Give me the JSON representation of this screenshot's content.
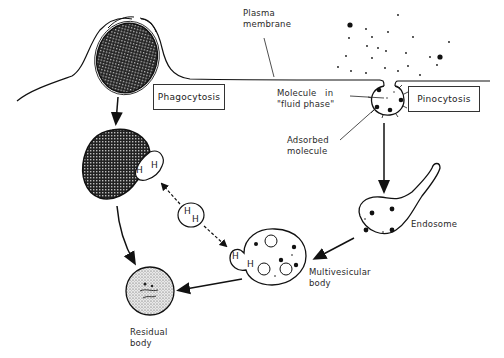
{
  "labels": {
    "plasma_membrane": "Plasma\nmembrane",
    "phagocytosis": "Phagocytosis",
    "pinocytosis": "Pinocytosis",
    "molecule_fluid_phase": "Molecule   in\n\"fluid phase\"",
    "adsorbed_molecule": "Adsorbed\nmolecule",
    "endosome": "Endosome",
    "multivesicular_body": "Multivesicular\nbody",
    "residual_body": "Residual\nbody"
  },
  "hydrolase_marks": {
    "phagosome_h1": "H",
    "phagosome_h2": "H",
    "lysosome_h1": "H",
    "lysosome_h2": "H",
    "mvb_h1": "H",
    "mvb_h2": "H"
  },
  "colors": {
    "line": "#1a1a1a",
    "background": "#ffffff",
    "label_text": "#2a2a2a"
  }
}
